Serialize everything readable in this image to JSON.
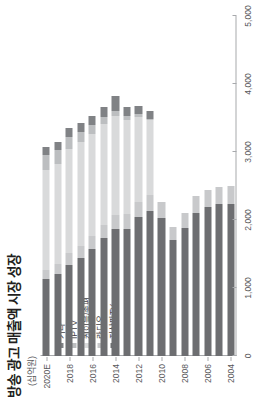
{
  "chart": {
    "title": "방송 광고 매출액 시장 성장",
    "unit_label": "(십억원)",
    "rotation_note": "90"
  },
  "legend": {
    "position": "inside-left",
    "items": [
      {
        "label": "기타",
        "color": "#808285"
      },
      {
        "label": "IPTV",
        "color": "#bcbec0"
      },
      {
        "label": "케이블/종편",
        "color": "#d9dadb"
      },
      {
        "label": "라디오",
        "color": "#c8c9cb"
      },
      {
        "label": "지상파TV",
        "color": "#6d6e71"
      }
    ]
  },
  "axes": {
    "value_ticks": [
      "0",
      "1,000",
      "2,000",
      "3,000",
      "4,000",
      "5,000"
    ],
    "category_ticks": [
      "2004",
      "2006",
      "2008",
      "2010",
      "2012",
      "2014",
      "2016",
      "2018",
      "2020E"
    ]
  },
  "chart_data": {
    "type": "bar",
    "orientation": "horizontal-stacked",
    "title": "방송 광고 매출액 시장 성장",
    "xlabel": "",
    "ylabel": "(십억원)",
    "ylim": [
      0,
      5000
    ],
    "grid": false,
    "legend_position": "inside-left",
    "categories": [
      "2004",
      "2005",
      "2006",
      "2007",
      "2008",
      "2009",
      "2010",
      "2011",
      "2012",
      "2013",
      "2014",
      "2015",
      "2016",
      "2017",
      "2018",
      "2019",
      "2020E"
    ],
    "series": [
      {
        "name": "지상파TV",
        "color": "#6d6e71",
        "values": [
          2240,
          2230,
          2190,
          2110,
          1880,
          1700,
          2030,
          2130,
          2040,
          1870,
          1870,
          1730,
          1580,
          1440,
          1340,
          1200,
          1130
        ]
      },
      {
        "name": "라디오",
        "color": "#c8c9cb",
        "values": [
          260,
          250,
          250,
          240,
          230,
          200,
          240,
          240,
          230,
          220,
          210,
          200,
          190,
          180,
          170,
          150,
          140
        ]
      },
      {
        "name": "케이블/종편",
        "color": "#d9dadb",
        "values": [
          0,
          0,
          0,
          0,
          0,
          0,
          0,
          1100,
          1250,
          1380,
          1450,
          1480,
          1500,
          1520,
          1530,
          1480,
          1470
        ]
      },
      {
        "name": "IPTV",
        "color": "#bcbec0",
        "values": [
          0,
          0,
          0,
          0,
          0,
          0,
          0,
          20,
          40,
          60,
          80,
          100,
          120,
          150,
          180,
          200,
          220
        ]
      },
      {
        "name": "기타",
        "color": "#808285",
        "values": [
          0,
          0,
          0,
          0,
          0,
          0,
          0,
          110,
          120,
          130,
          220,
          150,
          140,
          130,
          130,
          120,
          120
        ]
      }
    ],
    "totals": [
      2500,
      2480,
      2440,
      2350,
      2110,
      1900,
      2270,
      3600,
      3680,
      3660,
      3830,
      3660,
      3530,
      3420,
      3350,
      3150,
      3080
    ]
  }
}
